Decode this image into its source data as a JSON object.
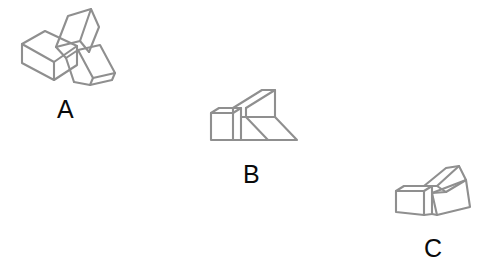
{
  "canvas": {
    "width": 487,
    "height": 279,
    "background_color": "#ffffff",
    "stroke_color": "#8f8f8f",
    "label_color": "#0a0a0a",
    "stroke_width": 2.1
  },
  "figures": [
    {
      "id": "a",
      "label": "A",
      "label_position": {
        "x": 57,
        "y": 97
      },
      "description": "3D block assembly: cube at lower-left with an upward-right wedge arm and a downward-right ramp arm"
    },
    {
      "id": "b",
      "label": "B",
      "label_position": {
        "x": 243,
        "y": 162
      },
      "description": "3D block assembly rotated: cube at left with wedge arm rising to upper-right and flat ramp extending right"
    },
    {
      "id": "c",
      "label": "C",
      "label_position": {
        "x": 424,
        "y": 236
      },
      "description": "3D block assembly rotated: cube at left with narrow wedge arm up-right and ramp extending right-down"
    }
  ],
  "labels": {
    "a": "A",
    "b": "B",
    "c": "C"
  }
}
